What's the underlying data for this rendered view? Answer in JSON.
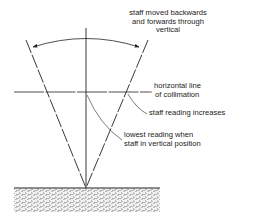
{
  "labels": {
    "staff_moved_line1": "staff moved backwards",
    "staff_moved_line2": "and forwards through",
    "staff_moved_line3": "vertical",
    "horizontal_line1": "horizontal line",
    "horizontal_line2": "of collimation",
    "staff_reading_increases": "staff reading increases",
    "lowest_reading_line1": "lowest reading when",
    "lowest_reading_line2": "staff in vertical position"
  },
  "colors": {
    "ink": "#222222",
    "background": "#ffffff",
    "ground": "#888888"
  }
}
